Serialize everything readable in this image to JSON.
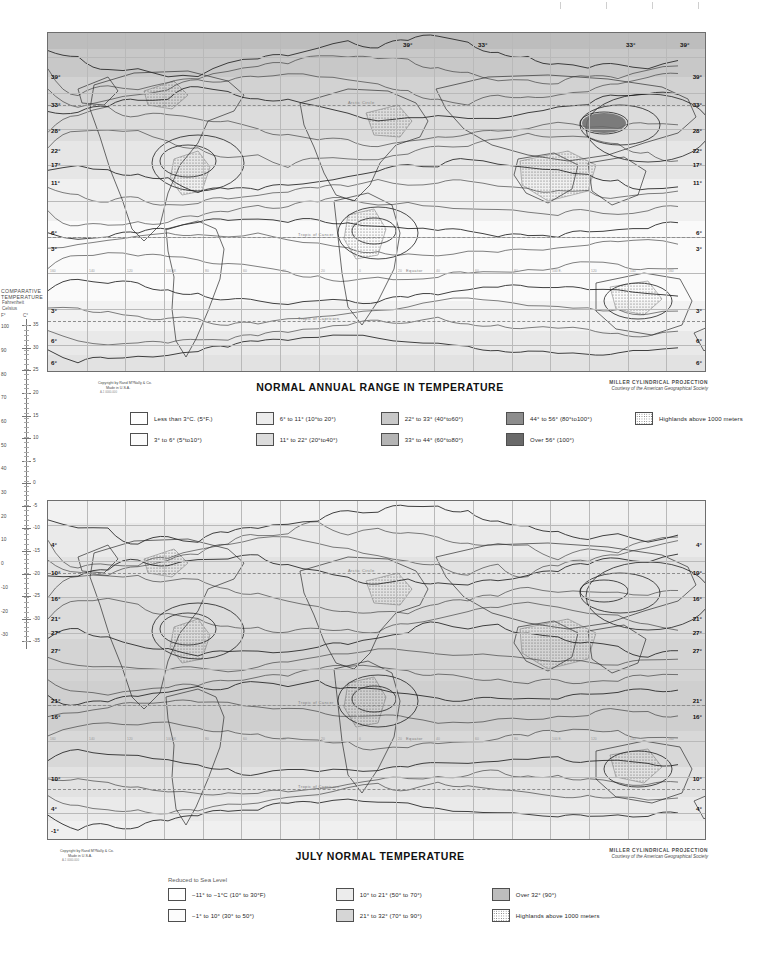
{
  "page": {
    "sheet_type": "world thematic map plate"
  },
  "temperature_scale": {
    "title_line1": "COMPARATIVE",
    "title_line2": "TEMPERATURE",
    "sub1": "Fahrenheit",
    "sub2": "Celsius",
    "unit_f": "F°",
    "unit_c": "C°",
    "fahrenheit_ticks": [
      "100",
      "90",
      "80",
      "70",
      "60",
      "50",
      "40",
      "30",
      "20",
      "10",
      "0",
      "-10",
      "-20",
      "-30"
    ],
    "celsius_ticks": [
      "35",
      "30",
      "25",
      "20",
      "15",
      "10",
      "5",
      "0",
      "-5",
      "-10",
      "-15",
      "-20",
      "-25",
      "-30",
      "-35"
    ]
  },
  "map1": {
    "title": "NORMAL ANNUAL RANGE IN TEMPERATURE",
    "projection": "MILLER CYLINDRICAL PROJECTION",
    "courtesy": "Courtesy of the American Geographical Society",
    "copyright_line1": "Copyright by Rand M?Nally & Co.",
    "copyright_line2": "Made in U.S.A.",
    "copyright_code": "A-1 0000-000",
    "isotherm_labels_left": [
      "39°",
      "33°",
      "28°",
      "22°",
      "17°",
      "11°",
      "6°",
      "3°",
      "3°",
      "6°",
      "6°"
    ],
    "isotherm_labels_right": [
      "39°",
      "33°",
      "28°",
      "22°",
      "17°",
      "11°",
      "6°",
      "3°",
      "3°",
      "6°",
      "6°"
    ],
    "isotherm_labels_top": [
      "39°",
      "33°",
      "33°",
      "39°"
    ],
    "geo_labels": [
      "Arctic Circle",
      "Tropic of Cancer",
      "Equator",
      "Tropic of Capricorn"
    ],
    "longitude_labels": [
      "160",
      "140",
      "120",
      "100 W.",
      "80",
      "60",
      "40",
      "20",
      "0",
      "20",
      "40",
      "60",
      "80",
      "100 E.",
      "120",
      "140",
      "160"
    ],
    "legend": [
      {
        "label": "Less than 3°C. (5°F.)",
        "color": "#ffffff",
        "pattern": "solid"
      },
      {
        "label": "3° to 6°  (5°to10°)",
        "color": "#fbfbfb",
        "pattern": "solid"
      },
      {
        "label": "6° to 11°  (10°to 20°)",
        "color": "#ececec",
        "pattern": "solid"
      },
      {
        "label": "11° to 22°  (20°to40°)",
        "color": "#dcdcdc",
        "pattern": "solid"
      },
      {
        "label": "22° to 33°  (40°to60°)",
        "color": "#c8c8c8",
        "pattern": "solid"
      },
      {
        "label": "33° to 44°  (60°to80°)",
        "color": "#b4b4b4",
        "pattern": "solid"
      },
      {
        "label": "44° to 56°  (80°to100°)",
        "color": "#8d8d8d",
        "pattern": "solid"
      },
      {
        "label": "Over 56°   (100°)",
        "color": "#6a6a6a",
        "pattern": "solid"
      },
      {
        "label": "Highlands above 1000 meters",
        "color": "#ffffff",
        "pattern": "stipple"
      }
    ]
  },
  "map2": {
    "title": "JULY NORMAL TEMPERATURE",
    "projection": "MILLER CYLINDRICAL PROJECTION",
    "courtesy": "Courtesy of the American Geographical Society",
    "copyright_line1": "Copyright by Rand M?Nally & Co.",
    "copyright_line2": "Made in U.S.A.",
    "copyright_code": "A-1 0000-000",
    "legend_heading": "Reduced to Sea Level",
    "isotherm_labels_left": [
      "4°",
      "10°",
      "16°",
      "21°",
      "27°",
      "27°",
      "21°",
      "16°",
      "10°",
      "4°",
      "-1°"
    ],
    "isotherm_labels_right": [
      "4°",
      "10°",
      "16°",
      "21°",
      "27°",
      "27°",
      "21°",
      "16°",
      "10°",
      "4°"
    ],
    "geo_labels": [
      "Arctic Circle",
      "Tropic of Cancer",
      "Equator",
      "Tropic of Capricorn"
    ],
    "legend": [
      {
        "label": "−11° to −1°C  (10° to 30°F)",
        "color": "#ffffff",
        "pattern": "solid"
      },
      {
        "label": "−1° to 10°   (30° to 50°)",
        "color": "#fcfcfc",
        "pattern": "solid"
      },
      {
        "label": "10° to 21°   (50° to 70°)",
        "color": "#ececec",
        "pattern": "solid"
      },
      {
        "label": "21° to 32°   (70° to 90°)",
        "color": "#d6d6d6",
        "pattern": "solid"
      },
      {
        "label": "Over 32°   (90°)",
        "color": "#bdbdbd",
        "pattern": "solid"
      },
      {
        "label": "Highlands above 1000 meters",
        "color": "#ffffff",
        "pattern": "stipple"
      }
    ]
  },
  "colors": {
    "frame": "#6e6e6e",
    "graticule": "#b9b9b9",
    "contour": "#2b2b2b",
    "text": "#1a1a1a"
  }
}
